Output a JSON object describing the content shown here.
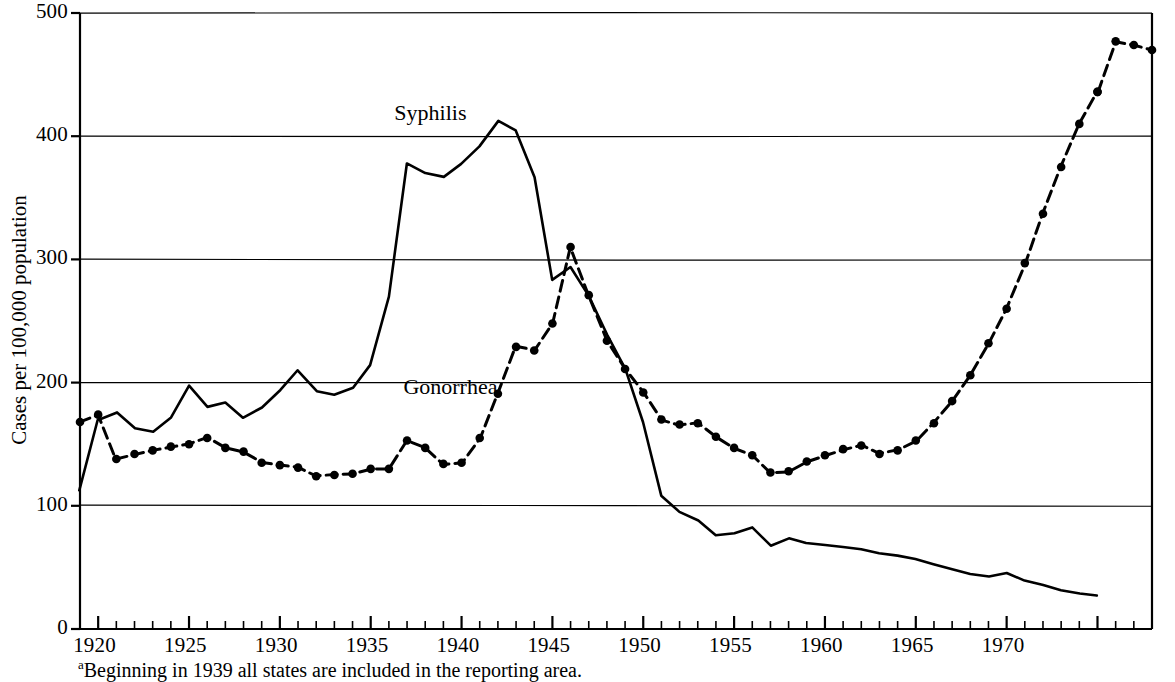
{
  "chart_data": {
    "type": "line",
    "title": "",
    "subtitle": "",
    "xlabel": "",
    "ylabel": "Cases per 100,000 population",
    "xlim": [
      1919,
      1975
    ],
    "ylim": [
      0,
      500
    ],
    "yticks": [
      0,
      100,
      200,
      300,
      400,
      500
    ],
    "ytick_labels": [
      "0",
      "100",
      "200",
      "300",
      "400",
      "500"
    ],
    "xticks": [
      1920,
      1925,
      1930,
      1935,
      1940,
      1945,
      1950,
      1955,
      1960,
      1965,
      1970
    ],
    "xtick_labels": [
      "1920",
      "1925",
      "1930",
      "1935",
      "1940",
      "1945",
      "1950",
      "1955",
      "1960",
      "1965",
      "1970"
    ],
    "minor_xticks_every": 1,
    "grid": "horizontal-only",
    "legend_position": "inline-annotations",
    "annotations": [
      {
        "text": "Syphilis",
        "x": 1936.3,
        "y": 418
      },
      {
        "text": "Gonorrhea",
        "x": 1936.8,
        "y": 196
      }
    ],
    "footnote": "Beginning in 1939 all states are included in the reporting area.",
    "footnote_marker": "a",
    "series": [
      {
        "name": "Syphilis",
        "style": "solid",
        "markers": false,
        "color": "#000000",
        "x": [
          1919,
          1920,
          1921,
          1922,
          1923,
          1924,
          1925,
          1926,
          1927,
          1928,
          1929,
          1930,
          1931,
          1932,
          1933,
          1934,
          1935,
          1936,
          1937,
          1938,
          1939,
          1940,
          1941,
          1942,
          1943,
          1944,
          1945,
          1946,
          1947,
          1948,
          1949,
          1950,
          1951,
          1952,
          1953,
          1954,
          1955,
          1956,
          1957,
          1958,
          1959,
          1960,
          1961,
          1962,
          1963,
          1964,
          1965,
          1966,
          1967,
          1968,
          1969,
          1970,
          1971,
          1972,
          1973,
          1974,
          1975
        ],
        "values": [
          112,
          170,
          176,
          163,
          160,
          172,
          197,
          180,
          184,
          172,
          180,
          194,
          210,
          193,
          190,
          196,
          214,
          270,
          378,
          370,
          367,
          378,
          392,
          412,
          405,
          367,
          283,
          294,
          271,
          239,
          211,
          168,
          108,
          95,
          88,
          76,
          78,
          83,
          68,
          73,
          70,
          68,
          67,
          65,
          62,
          60,
          57,
          53,
          49,
          45,
          43,
          45,
          39,
          36,
          32,
          29,
          27
        ]
      },
      {
        "name": "Gonorrhea",
        "style": "dashed-with-dots",
        "markers": true,
        "color": "#000000",
        "x": [
          1919,
          1920,
          1921,
          1922,
          1923,
          1924,
          1925,
          1926,
          1927,
          1928,
          1929,
          1930,
          1931,
          1932,
          1933,
          1934,
          1935,
          1936,
          1937,
          1938,
          1939,
          1940,
          1941,
          1942,
          1943,
          1944,
          1945,
          1946,
          1947,
          1948,
          1949,
          1950,
          1951,
          1952,
          1953,
          1954,
          1955,
          1956,
          1957,
          1958,
          1959,
          1960,
          1961,
          1962,
          1963,
          1964,
          1965,
          1966,
          1967,
          1968,
          1969,
          1970,
          1971,
          1972,
          1973,
          1974,
          1975
        ],
        "values": [
          168,
          174,
          138,
          142,
          145,
          148,
          150,
          155,
          147,
          144,
          135,
          133,
          131,
          124,
          125,
          126,
          130,
          130,
          153,
          147,
          134,
          135,
          155,
          191,
          229,
          226,
          248,
          310,
          271,
          234,
          211,
          192,
          170,
          166,
          167,
          156,
          147,
          141,
          127,
          128,
          136,
          141,
          146,
          149,
          142,
          145,
          153,
          167,
          185,
          206,
          232,
          260,
          297,
          337,
          375,
          410,
          436
        ]
      },
      {
        "name": "Gonorrhea-tail",
        "style": "dashed-with-dots",
        "markers": true,
        "color": "#000000",
        "x": [
          1975,
          1976,
          1977,
          1978
        ],
        "values": [
          436,
          477,
          474,
          470
        ]
      }
    ]
  },
  "axes": {
    "y_axis_title": "Cases per 100,000 population"
  },
  "plot_geometry": {
    "left_px": 80,
    "right_px": 1152,
    "top_px": 13,
    "bottom_px": 629,
    "x_min": 1919,
    "x_max": 1978,
    "y_min": 0,
    "y_max": 500
  }
}
